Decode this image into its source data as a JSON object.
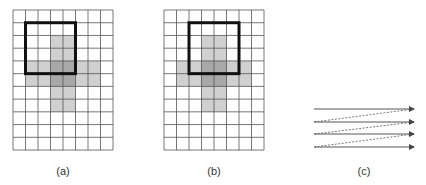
{
  "panels": [
    {
      "id": "a",
      "label": "(a)",
      "grid": {
        "x": 13,
        "y": 10,
        "cols": 8,
        "rows": 11,
        "cell_w": 12.5,
        "cell_h": 12.73
      },
      "window": {
        "col": 1,
        "row": 1,
        "cols": 4,
        "rows": 4
      },
      "label_x": 63
    },
    {
      "id": "b",
      "label": "(b)",
      "grid": {
        "x": 164,
        "y": 10,
        "cols": 8,
        "rows": 11,
        "cell_w": 12.5,
        "cell_h": 12.73
      },
      "window": {
        "col": 2,
        "row": 1,
        "cols": 4,
        "rows": 4
      },
      "label_x": 214
    }
  ],
  "shading": {
    "vertical_bar": {
      "col": 3,
      "row": 2,
      "cols": 2,
      "rows": 6
    },
    "horizontal_bar": {
      "col": 1,
      "row": 4,
      "cols": 6,
      "rows": 2
    },
    "light_color": "#d0d0d0",
    "dark_color": "#a8a8a8"
  },
  "scan_panel": {
    "id": "c",
    "label": "(c)",
    "label_x": 364,
    "x_start": 314,
    "x_end": 414,
    "rows_y": [
      109,
      122,
      134,
      147
    ]
  },
  "colors": {
    "grid_line": "#555555",
    "window_border": "#111111",
    "arrow": "#555555"
  }
}
